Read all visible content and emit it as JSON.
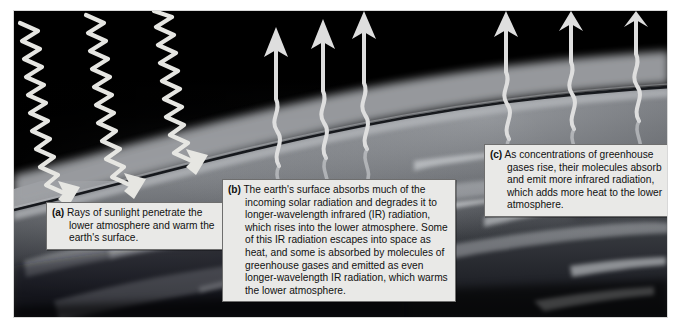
{
  "figure": {
    "kind": "greenhouse-effect-illustration",
    "alt_title": "The greenhouse effect in the earth's lower atmosphere",
    "colors": {
      "space": "#030303",
      "atmosphere_haze": "#8f9195",
      "earth_surface": "#55585c",
      "ray_stroke": "#e4e4e0",
      "caption_bg": "#e9e9e7",
      "caption_border": "#6e6e6e",
      "caption_text": "#111111",
      "page_bg": "#ffffff"
    },
    "scene_layers": [
      "outer space (black, top)",
      "upper atmosphere haze band (grey gradient)",
      "horizon line (dark thin arc)",
      "earth surface with clouds (mottled grey)"
    ]
  },
  "captions": [
    {
      "id": "a",
      "label": "(a)",
      "text": "Rays of sunlight penetrate the lower atmosphere and warm the earth's surface."
    },
    {
      "id": "b",
      "label": "(b)",
      "text": "The earth's surface absorbs much of the incoming solar radiation and degrades it to longer-wavelength infrared (IR) radiation, which rises into the lower atmosphere. Some of this IR radiation escapes into space as heat, and some is absorbed by molecules of greenhouse gases and emitted as even longer-wavelength IR radiation, which warms the lower atmosphere."
    },
    {
      "id": "c",
      "label": "(c)",
      "text": "As concentrations of greenhouse gases rise, their molecules absorb and emit more infrared radiation, which adds more heat to the lower atmosphere."
    }
  ],
  "arrows": {
    "incoming_sunlight": {
      "icon": "zigzag-arrow-down-right-icon",
      "count": 3,
      "direction": "down-right",
      "waveform": "tight zigzag (short wavelength)",
      "meaning": "incoming solar radiation"
    },
    "outgoing_ir_center": {
      "icon": "wavy-arrow-up-icon",
      "count": 3,
      "direction": "up",
      "waveform": "long smooth wave (long wavelength)",
      "meaning": "infrared radiation rising from surface"
    },
    "outgoing_ir_right": {
      "icon": "wavy-arrow-up-icon",
      "count": 3,
      "direction": "up",
      "waveform": "long smooth wave (long wavelength)",
      "meaning": "re-emitted infrared radiation"
    }
  }
}
